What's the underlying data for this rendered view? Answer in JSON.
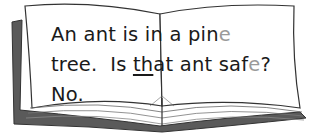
{
  "illustration": "open-book",
  "passage": {
    "line1": {
      "before": "An ant is in a pin",
      "silent": "e"
    },
    "line2": {
      "a": "tree.  Is ",
      "underlined": "th",
      "b": "at ant saf",
      "silent": "e",
      "end": "?"
    },
    "line3": {
      "text": "No."
    }
  },
  "colors": {
    "text": "#1a1a1a",
    "silent_letter": "#9a9a9a",
    "book_cover": "#5a5a5a",
    "outline": "#333333"
  }
}
